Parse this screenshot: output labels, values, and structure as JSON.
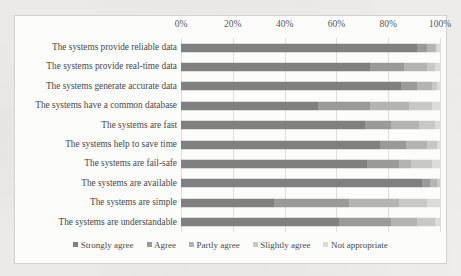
{
  "chart_data": {
    "type": "bar",
    "subtype": "stacked-horizontal-100-percent",
    "title": "",
    "xlabel": "",
    "ylabel": "",
    "xlim": [
      0,
      100
    ],
    "xticks": [
      "0%",
      "20%",
      "40%",
      "60%",
      "80%",
      "100%"
    ],
    "xtick_values": [
      0,
      20,
      40,
      60,
      80,
      100
    ],
    "grid": true,
    "legend_position": "bottom",
    "categories": [
      "The systems provide reliable data",
      "The systems provide real-time data",
      "The systems generate accurate data",
      "The systems have a common database",
      "The systems are fast",
      "The systems help to save time",
      "The systems are fail-safe",
      "The systems are available",
      "The systems are simple",
      "The systems are understandable"
    ],
    "series": [
      {
        "name": "Strongly agree",
        "color": "#808080",
        "values": [
          91,
          73,
          85,
          53,
          71,
          77,
          72,
          93,
          36,
          61
        ]
      },
      {
        "name": "Agree",
        "color": "#9a9a9a",
        "values": [
          4,
          13,
          6,
          20,
          10,
          10,
          12,
          3,
          29,
          20
        ]
      },
      {
        "name": "Partly agree",
        "color": "#b4b4b4",
        "values": [
          3,
          9,
          6,
          15,
          11,
          8,
          5,
          3,
          19,
          10
        ]
      },
      {
        "name": "Slightly agree",
        "color": "#c8c8c8",
        "values": [
          1,
          3,
          2,
          9,
          6,
          4,
          8,
          1,
          11,
          7
        ]
      },
      {
        "name": "Not appropriate",
        "color": "#dcdcdc",
        "values": [
          1,
          2,
          1,
          3,
          2,
          1,
          3,
          0,
          5,
          2
        ]
      }
    ]
  },
  "legend": {
    "items": [
      {
        "label": "Strongly agree"
      },
      {
        "label": "Agree"
      },
      {
        "label": "Partly agree"
      },
      {
        "label": "Slightly agree"
      },
      {
        "label": "Not appropriate"
      }
    ]
  }
}
